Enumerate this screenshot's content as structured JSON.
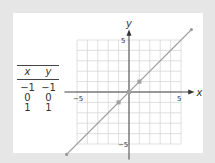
{
  "table": {
    "headers": [
      "x",
      "y"
    ],
    "rows": [
      [
        "−1",
        "−1"
      ],
      [
        "0",
        "0"
      ],
      [
        "1",
        "1"
      ]
    ]
  },
  "chart_data": {
    "type": "line",
    "title": "",
    "xlabel": "x",
    "ylabel": "y",
    "xlim": [
      -6,
      6
    ],
    "ylim": [
      -6,
      6
    ],
    "grid": true,
    "tick_labels": {
      "x_neg": "−5",
      "x_pos": "5",
      "y_pos": "5",
      "y_neg": "−5"
    },
    "series": [
      {
        "name": "y = x",
        "x": [
          -6,
          6
        ],
        "y": [
          -6,
          6
        ],
        "color": "#9a9a9a"
      }
    ],
    "points": {
      "x": [
        -1,
        0,
        1
      ],
      "y": [
        -1,
        0,
        1
      ],
      "color": "#a0a0a0"
    }
  }
}
